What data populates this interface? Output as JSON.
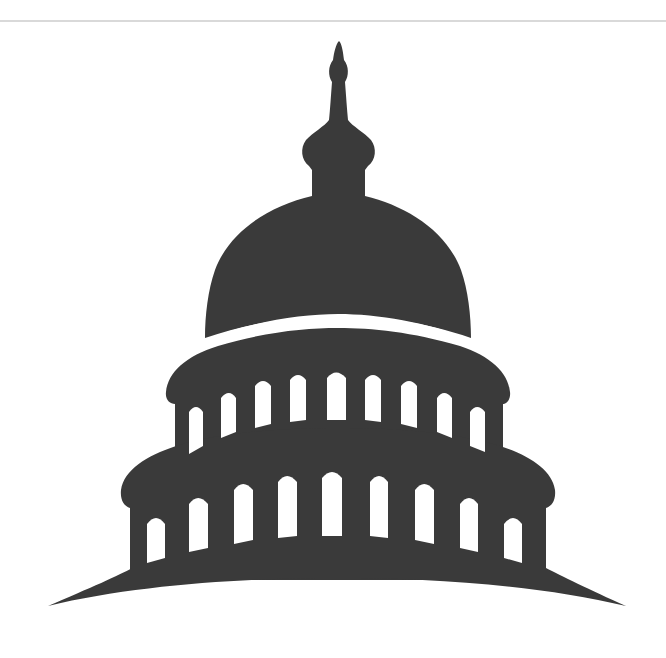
{
  "image": {
    "subject": "capitol dome silhouette icon",
    "description": "Dark gray silhouette of a capitol building dome with a lantern spire, a two-tier colonnade of arched windows, and a curved base",
    "colors": {
      "background": "#ffffff",
      "silhouette": "#3a3a3a",
      "rule": "#d9d9d9"
    },
    "elements": {
      "spire": "spire-icon",
      "dome": "dome-icon",
      "upper_tier_windows": 9,
      "lower_tier_windows": 9,
      "base": "curved-base"
    }
  }
}
